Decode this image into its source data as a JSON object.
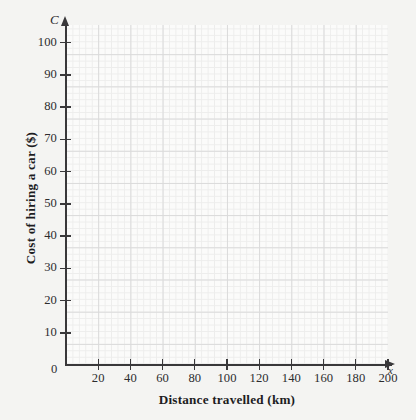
{
  "chart_data": {
    "type": "line",
    "title": "",
    "subtitle": "",
    "xlabel": "Distance travelled (km)",
    "ylabel": "Cost of hiring a car ($)",
    "x_symbol": "x",
    "y_symbol": "C",
    "xlim": [
      0,
      200
    ],
    "ylim": [
      0,
      100
    ],
    "x_ticks": [
      0,
      20,
      40,
      60,
      80,
      100,
      120,
      140,
      160,
      180,
      200
    ],
    "y_ticks": [
      0,
      10,
      20,
      30,
      40,
      50,
      60,
      70,
      80,
      90,
      100
    ],
    "x_tick_labels": [
      "0",
      "20",
      "40",
      "60",
      "80",
      "100",
      "120",
      "140",
      "160",
      "180",
      "200"
    ],
    "y_tick_labels": [
      "0",
      "10",
      "20",
      "30",
      "40",
      "50",
      "60",
      "70",
      "80",
      "90",
      "100"
    ],
    "x_major_step": 20,
    "y_major_step": 10,
    "minor_divisions_per_major": 5,
    "grid": true,
    "grid_style": "graph-paper minor and major gridlines",
    "legend": null,
    "legend_position": "none",
    "series": [],
    "values": [],
    "annotations": [],
    "note": "Blank graph-paper axes; no data series plotted"
  },
  "colors": {
    "background": "#f4f4f2",
    "plot_background": "#fbfbfa",
    "axis": "#39383a",
    "major_grid": "#dadada",
    "minor_grid": "#ededec",
    "tick_label": "#2c2c2e",
    "axis_title": "#1d1d1f"
  }
}
